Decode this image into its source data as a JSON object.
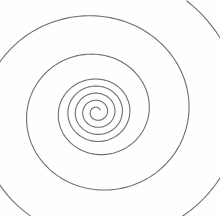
{
  "image": {
    "subject": "Spiral line drawing",
    "background_color": "#fefefe",
    "stroke_color": "#6e6e6e",
    "center": [
      97,
      112
    ],
    "turns": 7
  }
}
